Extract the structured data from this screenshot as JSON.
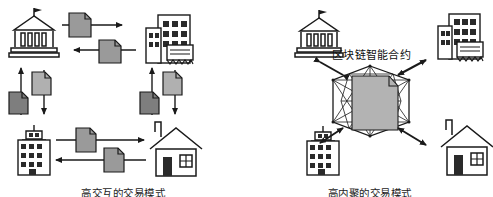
{
  "figure": {
    "title": "",
    "background": "#ffffff",
    "ink": "#1a1a1a",
    "doc_fill": "#9a9a9a",
    "node_fill": "#b3b3b3"
  },
  "left_panel": {
    "caption": "高交互的交易模式",
    "entities": [
      {
        "id": "bank",
        "icon": "bank-icon",
        "label": "银行",
        "position": "top-left"
      },
      {
        "id": "office",
        "icon": "office-building-icon",
        "label": "企业",
        "position": "top-right"
      },
      {
        "id": "apartment",
        "icon": "apartment-building-icon",
        "label": "机构",
        "position": "bottom-left"
      },
      {
        "id": "house",
        "icon": "house-icon",
        "label": "个人",
        "position": "bottom-right"
      }
    ],
    "exchanges": [
      {
        "id": "bank-to-office",
        "icon": "document-icon",
        "direction": "right"
      },
      {
        "id": "office-to-bank",
        "icon": "document-icon",
        "direction": "left"
      },
      {
        "id": "bank-to-apartment",
        "icon": "document-icon",
        "direction": "up"
      },
      {
        "id": "apartment-to-bank",
        "icon": "document-icon",
        "direction": "down"
      },
      {
        "id": "office-to-house",
        "icon": "document-icon",
        "direction": "up"
      },
      {
        "id": "house-to-office",
        "icon": "document-icon",
        "direction": "down"
      },
      {
        "id": "apartment-to-house",
        "icon": "document-icon",
        "direction": "right"
      },
      {
        "id": "house-to-apartment",
        "icon": "document-icon",
        "direction": "left"
      }
    ]
  },
  "right_panel": {
    "caption": "高内聚的交易模式",
    "center_label": "区块链智能合约",
    "center_node": {
      "id": "blockchain-node",
      "icon": "polyhedron-contract-icon",
      "shape": "hexagon-wireframe"
    },
    "entities": [
      {
        "id": "bank",
        "icon": "bank-icon",
        "label": "银行",
        "position": "top-left"
      },
      {
        "id": "office",
        "icon": "office-building-icon",
        "label": "企业",
        "position": "top-right"
      },
      {
        "id": "apartment",
        "icon": "apartment-building-icon",
        "label": "机构",
        "position": "bottom-left"
      },
      {
        "id": "house",
        "icon": "house-icon",
        "label": "个人",
        "position": "bottom-right"
      }
    ],
    "connections": [
      {
        "id": "node-bank",
        "icon": "double-arrow-icon",
        "direction": "bidirectional"
      },
      {
        "id": "node-office",
        "icon": "double-arrow-icon",
        "direction": "bidirectional"
      },
      {
        "id": "node-apartment",
        "icon": "double-arrow-icon",
        "direction": "bidirectional"
      },
      {
        "id": "node-house",
        "icon": "double-arrow-icon",
        "direction": "bidirectional"
      }
    ]
  }
}
